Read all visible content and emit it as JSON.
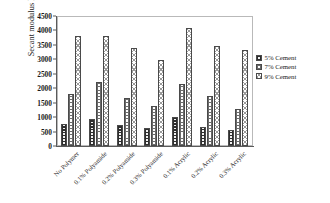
{
  "chart_data": {
    "type": "bar",
    "title": "",
    "xlabel": "",
    "ylabel": "Secant modulus E50 (kg/cm2)",
    "ylabel_parts": {
      "prefix": "Secant modulus E",
      "sub": "50",
      "unit_open": " (kg/cm",
      "sup": "2",
      "unit_close": ")"
    },
    "ylim": [
      0,
      4500
    ],
    "ytick_step": 500,
    "yticks": [
      "0",
      "500",
      "1000",
      "1500",
      "2000",
      "2500",
      "3000",
      "3500",
      "4000",
      "4500"
    ],
    "grid": false,
    "legend_position": "right",
    "categories": [
      "No Polymer",
      "0.1% Polyamide",
      "0.2% Polyamide",
      "0.3% Polyamide",
      "0.1% Acrylic",
      "0.2% Acrylic",
      "0.3% Acrylic"
    ],
    "series": [
      {
        "name": "5% Cement",
        "pattern": "dark-checker",
        "values": [
          760,
          935,
          740,
          620,
          1020,
          650,
          560
        ]
      },
      {
        "name": "7% Cement",
        "pattern": "grid",
        "values": [
          1810,
          2200,
          1650,
          1400,
          2130,
          1720,
          1290
        ]
      },
      {
        "name": "9% Cement",
        "pattern": "diagonal-crosshatch",
        "values": [
          3800,
          3810,
          3390,
          2970,
          4090,
          3470,
          3320
        ]
      }
    ]
  },
  "legend": {
    "items": [
      {
        "label": "5% Cement"
      },
      {
        "label": "7% Cement"
      },
      {
        "label": "9% Cement"
      }
    ]
  },
  "colors": {
    "axis": "#5a5a5a",
    "frame": "#b9b9b9",
    "bar_outline": "#4a4a4a",
    "series_1": "#2e2e2e",
    "series_2": "#6b6b6b",
    "series_3": "#9a9a9a",
    "background": "#ffffff"
  }
}
